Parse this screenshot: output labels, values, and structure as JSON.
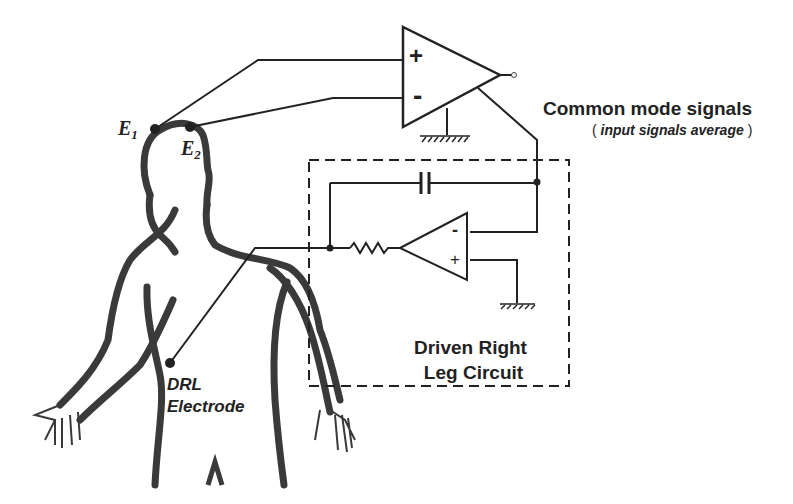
{
  "diagram": {
    "type": "circuit-schematic",
    "electrodes": {
      "e1": {
        "label": "E",
        "sub": "1"
      },
      "e2": {
        "label": "E",
        "sub": "2"
      },
      "drl": {
        "line1": "DRL",
        "line2": "Electrode"
      }
    },
    "instrumentation_amp": {
      "plus": "+",
      "minus": "-"
    },
    "drl_amp": {
      "plus": "+",
      "minus": "-"
    },
    "annotation": {
      "title": "Common mode signals",
      "open_paren": "(",
      "note": "input signals average",
      "close_paren": ")"
    },
    "circuit_box": {
      "line1": "Driven Right",
      "line2": "Leg Circuit"
    },
    "colors": {
      "stroke": "#222222",
      "body": "#3a3a3a",
      "background": "#ffffff"
    }
  }
}
